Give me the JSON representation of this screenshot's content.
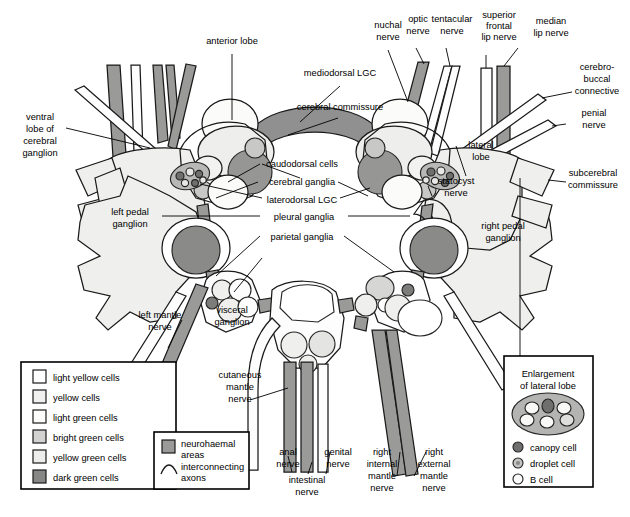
{
  "diagram": {
    "colors": {
      "light_yellow": "#ffffff",
      "yellow": "#f2f2f0",
      "light_green": "#fbfbfa",
      "bright_green": "#d4d4d2",
      "yellow_green": "#eeeeec",
      "dark_green": "#8a8a88",
      "neurohaemal": "#9a9a98",
      "ganglion_fill": "#efefed",
      "commissure": "#909090",
      "outline": "#1a1a1a",
      "background": "#ffffff"
    }
  },
  "labels": {
    "anterior_lobe": "anterior lobe",
    "mediodorsal_lgc": "mediodorsal LGC",
    "cerebral_commissure": "cerebral commissure",
    "nuchal_nerve": "nuchal\nnerve",
    "optic_nerve": "optic\nnerve",
    "tentacular_nerve": "tentacular\nnerve",
    "superior_frontal_lip_nerve": "superior\nfrontal\nlip nerve",
    "median_lip_nerve": "median\nlip nerve",
    "cerebro_buccal_connective": "cerebro-\nbuccal\nconnective",
    "penial_nerve": "penial\nnerve",
    "subcerebral_commissure": "subcerebral\ncommissure",
    "lateral_lobe": "lateral\nlobe",
    "statocyst_nerve": "statocyst\nnerve",
    "ventral_lobe_of_cerebral_ganglion": "ventral\nlobe of\ncerebral\nganglion",
    "left_pedal_ganglion": "left pedal\nganglion",
    "right_pedal_ganglion": "right pedal\nganglion",
    "caudodorsal_cells": "caudodorsal cells",
    "cerebral_ganglia": "cerebral ganglia",
    "laterodorsal_lgc": "laterodorsal LGC",
    "pleural_ganglia": "pleural ganglia",
    "parietal_ganglia": "parietal ganglia",
    "left_mantle_nerve": "left mantle\nnerve",
    "visceral_ganglion": "visceral\nganglion",
    "cutaneous_mantle_nerve": "cutaneous\nmantle\nnerve",
    "anal_nerve": "anal\nnerve",
    "intestinal_nerve": "intestinal\nnerve",
    "genital_nerve": "genital\nnerve",
    "right_internal_mantle_nerve": "right\ninternal\nmantle\nnerve",
    "right_external_mantle_nerve": "right\nexternal\nmantle\nnerve"
  },
  "label_lines": {
    "anterior_lobe": [
      "anterior lobe"
    ],
    "mediodorsal_lgc": [
      "mediodorsal LGC"
    ],
    "cerebral_commissure": [
      "cerebral commissure"
    ],
    "nuchal_nerve": [
      "nuchal",
      "nerve"
    ],
    "optic_nerve": [
      "optic",
      "nerve"
    ],
    "tentacular_nerve": [
      "tentacular",
      "nerve"
    ],
    "superior_frontal_lip_nerve": [
      "superior",
      "frontal",
      "lip nerve"
    ],
    "median_lip_nerve": [
      "median",
      "lip nerve"
    ],
    "cerebro_buccal_connective": [
      "cerebro-",
      "buccal",
      "connective"
    ],
    "penial_nerve": [
      "penial",
      "nerve"
    ],
    "subcerebral_commissure": [
      "subcerebral",
      "commissure"
    ],
    "lateral_lobe": [
      "lateral",
      "lobe"
    ],
    "statocyst_nerve": [
      "statocyst",
      "nerve"
    ],
    "ventral_lobe_of_cerebral_ganglion": [
      "ventral",
      "lobe of",
      "cerebral",
      "ganglion"
    ],
    "left_pedal_ganglion": [
      "left pedal",
      "ganglion"
    ],
    "right_pedal_ganglion": [
      "right pedal",
      "ganglion"
    ],
    "caudodorsal_cells": [
      "caudodorsal cells"
    ],
    "cerebral_ganglia": [
      "cerebral ganglia"
    ],
    "laterodorsal_lgc": [
      "laterodorsal LGC"
    ],
    "pleural_ganglia": [
      "pleural ganglia"
    ],
    "parietal_ganglia": [
      "parietal ganglia"
    ],
    "left_mantle_nerve": [
      "left mantle",
      "nerve"
    ],
    "visceral_ganglion": [
      "visceral",
      "ganglion"
    ],
    "cutaneous_mantle_nerve": [
      "cutaneous",
      "mantle",
      "nerve"
    ],
    "anal_nerve": [
      "anal",
      "nerve"
    ],
    "intestinal_nerve": [
      "intestinal",
      "nerve"
    ],
    "genital_nerve": [
      "genital",
      "nerve"
    ],
    "right_internal_mantle_nerve": [
      "right",
      "internal",
      "mantle",
      "nerve"
    ],
    "right_external_mantle_nerve": [
      "right",
      "external",
      "mantle",
      "nerve"
    ]
  },
  "legend": {
    "cell_types": [
      {
        "label": "light yellow cells",
        "color": "#ffffff"
      },
      {
        "label": "yellow cells",
        "color": "#f0f0ee"
      },
      {
        "label": "light green cells",
        "color": "#fcfcfb"
      },
      {
        "label": "bright green cells",
        "color": "#d2d2d0"
      },
      {
        "label": "yellow green cells",
        "color": "#ededeb"
      },
      {
        "label": "dark green cells",
        "color": "#878785"
      }
    ],
    "extras": [
      {
        "label": "neurohaemal\nareas",
        "lines": [
          "neurohaemal",
          "areas"
        ],
        "color": "#9a9a98",
        "kind": "swatch"
      },
      {
        "label": "interconnecting\naxons",
        "lines": [
          "interconnecting",
          "axons"
        ],
        "color": "#1a1a1a",
        "kind": "arc"
      }
    ]
  },
  "enlargement": {
    "title_lines": [
      "Enlargement",
      "of lateral lobe"
    ],
    "title": "Enlargement of lateral lobe",
    "cells": [
      {
        "label": "canopy cell",
        "color": "#6f6f6d"
      },
      {
        "label": "droplet cell",
        "color": "#c4c4c2"
      },
      {
        "label": "B cell",
        "color": "#fafafa"
      }
    ]
  }
}
